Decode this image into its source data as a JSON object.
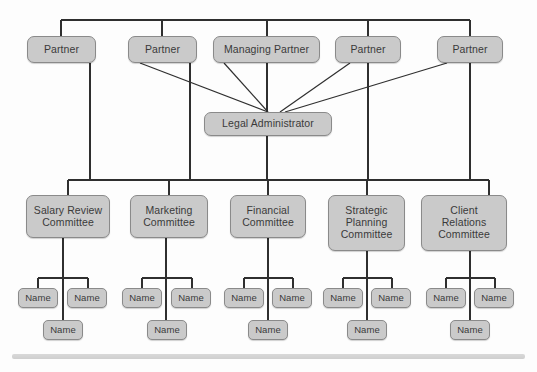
{
  "diagram": {
    "type": "org-chart",
    "colors": {
      "node_fill": "#cacaca",
      "node_border": "#8a8a8a",
      "text": "#3a3a3a",
      "edge": "#2f2f2f",
      "background": "#fdfdfd",
      "footer_bar": "#d9d9d9"
    },
    "levels": {
      "partners_label": "Partners",
      "administrator_label": "Administrator",
      "committees_label": "Committees",
      "members_label": "Committee Members"
    }
  },
  "nodes": {
    "partners": [
      {
        "id": "partner-1",
        "label": "Partner",
        "x": 27,
        "y": 36,
        "w": 69,
        "h": 27
      },
      {
        "id": "partner-2",
        "label": "Partner",
        "x": 128,
        "y": 36,
        "w": 69,
        "h": 27
      },
      {
        "id": "managing-partner",
        "label": "Managing Partner",
        "x": 213,
        "y": 36,
        "w": 107,
        "h": 27
      },
      {
        "id": "partner-4",
        "label": "Partner",
        "x": 335,
        "y": 36,
        "w": 66,
        "h": 27
      },
      {
        "id": "partner-5",
        "label": "Partner",
        "x": 437,
        "y": 36,
        "w": 66,
        "h": 27
      }
    ],
    "administrator": {
      "id": "legal-administrator",
      "label": "Legal Administrator",
      "x": 204,
      "y": 112,
      "w": 128,
      "h": 24
    },
    "committees": [
      {
        "id": "salary-review-committee",
        "label": "Salary Review\nCommittee",
        "x": 26,
        "y": 195,
        "w": 84,
        "h": 43
      },
      {
        "id": "marketing-committee",
        "label": "Marketing\nCommittee",
        "x": 130,
        "y": 195,
        "w": 78,
        "h": 43
      },
      {
        "id": "financial-committee",
        "label": "Financial\nCommittee",
        "x": 230,
        "y": 195,
        "w": 76,
        "h": 43
      },
      {
        "id": "strategic-planning-committee",
        "label": "Strategic\nPlanning\nCommittee",
        "x": 328,
        "y": 195,
        "w": 77,
        "h": 56
      },
      {
        "id": "client-relations-committee",
        "label": "Client\nRelations\nCommittee",
        "x": 421,
        "y": 195,
        "w": 86,
        "h": 56
      }
    ],
    "members": [
      {
        "id": "member-1-left",
        "label": "Name",
        "x": 18,
        "y": 288,
        "w": 40,
        "h": 20
      },
      {
        "id": "member-1-right",
        "label": "Name",
        "x": 67,
        "y": 288,
        "w": 40,
        "h": 20
      },
      {
        "id": "member-1-bottom",
        "label": "Name",
        "x": 43,
        "y": 320,
        "w": 40,
        "h": 20
      },
      {
        "id": "member-2-left",
        "label": "Name",
        "x": 122,
        "y": 288,
        "w": 40,
        "h": 20
      },
      {
        "id": "member-2-right",
        "label": "Name",
        "x": 171,
        "y": 288,
        "w": 40,
        "h": 20
      },
      {
        "id": "member-2-bottom",
        "label": "Name",
        "x": 147,
        "y": 320,
        "w": 40,
        "h": 20
      },
      {
        "id": "member-3-left",
        "label": "Name",
        "x": 224,
        "y": 288,
        "w": 40,
        "h": 20
      },
      {
        "id": "member-3-right",
        "label": "Name",
        "x": 272,
        "y": 288,
        "w": 40,
        "h": 20
      },
      {
        "id": "member-3-bottom",
        "label": "Name",
        "x": 248,
        "y": 320,
        "w": 40,
        "h": 20
      },
      {
        "id": "member-4-left",
        "label": "Name",
        "x": 323,
        "y": 288,
        "w": 40,
        "h": 20
      },
      {
        "id": "member-4-right",
        "label": "Name",
        "x": 371,
        "y": 288,
        "w": 40,
        "h": 20
      },
      {
        "id": "member-4-bottom",
        "label": "Name",
        "x": 347,
        "y": 320,
        "w": 40,
        "h": 20
      },
      {
        "id": "member-5-left",
        "label": "Name",
        "x": 426,
        "y": 288,
        "w": 40,
        "h": 20
      },
      {
        "id": "member-5-right",
        "label": "Name",
        "x": 474,
        "y": 288,
        "w": 40,
        "h": 20
      },
      {
        "id": "member-5-bottom",
        "label": "Name",
        "x": 450,
        "y": 320,
        "w": 40,
        "h": 20
      }
    ]
  }
}
